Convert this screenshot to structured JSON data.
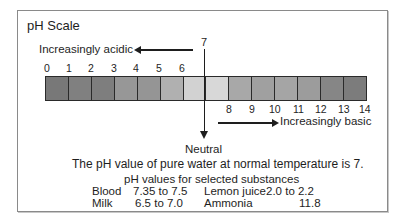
{
  "title": "pH Scale",
  "acidic_label": "Increasingly acidic",
  "basic_label": "Increasingly basic",
  "neutral_value": "7",
  "neutral_label": "Neutral",
  "water_note": "The pH value of pure water at normal temperature is 7.",
  "substances_title": "pH values for selected substances",
  "scale": {
    "top_ticks": [
      "0",
      "1",
      "2",
      "3",
      "4",
      "5",
      "6"
    ],
    "bottom_ticks": [
      "8",
      "9",
      "10",
      "11",
      "12",
      "13",
      "14"
    ],
    "segment_colors": [
      "#787878",
      "#808080",
      "#7e7e7e",
      "#979797",
      "#959595",
      "#b0b0b0",
      "#d2d2d2",
      "#d8d8d8",
      "#a8a8a8",
      "#a0a0a0",
      "#a5a5a5",
      "#9c9c9c",
      "#868686",
      "#7c7c7c"
    ]
  },
  "substances": [
    {
      "name": "Blood",
      "range": "7.35 to  7.5"
    },
    {
      "name": "Milk",
      "range": "6.5 to  7.0"
    },
    {
      "name": "Lemon juice",
      "range": "2.0 to   2.2"
    },
    {
      "name": "Ammonia",
      "range": "11.8"
    }
  ]
}
